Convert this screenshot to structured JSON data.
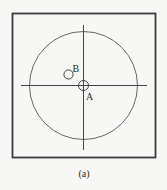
{
  "figure": {
    "caption": "(a)",
    "labels": {
      "a": "A",
      "b": "B"
    },
    "colors": {
      "background": "#f7f7f5",
      "frame": "#3a3a3a",
      "stroke": "#555555",
      "text": "#2a2a2a"
    }
  }
}
